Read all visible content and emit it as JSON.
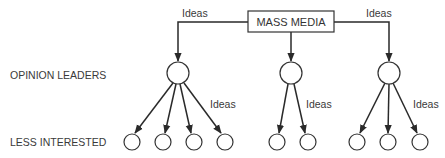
{
  "diagram": {
    "source": "MASS MEDIA",
    "flow_label": "Ideas",
    "row_labels": {
      "opinion_leaders": "OPINION LEADERS",
      "less_interested": "LESS INTERESTED"
    },
    "groups": [
      {
        "leader": "opinion-leader-1",
        "followers": 4
      },
      {
        "leader": "opinion-leader-2",
        "followers": 2
      },
      {
        "leader": "opinion-leader-3",
        "followers": 3
      }
    ],
    "edge_labels": [
      "Ideas",
      "Ideas",
      "Ideas",
      "Ideas",
      "Ideas"
    ]
  }
}
